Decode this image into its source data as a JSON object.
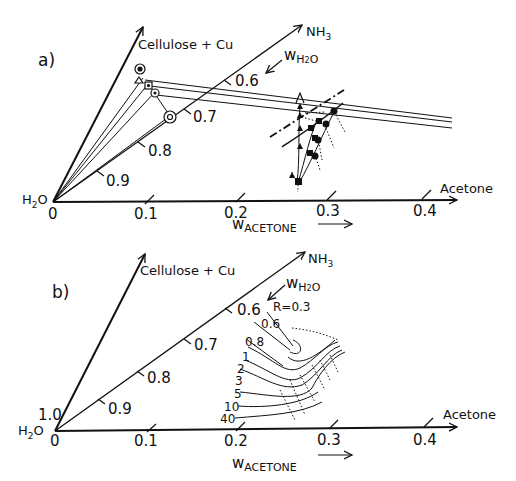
{
  "panel_a": {
    "label": "a)",
    "axes": {
      "cellulose": "Cellulose + Cu",
      "nh3": "NH",
      "nh3_sub": "3",
      "water_origin": "H",
      "water_sub": "2",
      "water_o": "O",
      "acetone": "Acetone"
    },
    "acetone_ticks": [
      "0",
      "0.1",
      "0.2",
      "0.3",
      "0.4"
    ],
    "water_ticks": [
      "0.6",
      "0.7",
      "0.8",
      "0.9"
    ],
    "w_acetone": {
      "w": "w",
      "sub": "ACETONE"
    },
    "w_h2o": {
      "w": "w",
      "sub": "H",
      "sub2": "2",
      "tail": "O"
    }
  },
  "panel_b": {
    "label": "b)",
    "axes": {
      "cellulose": "Cellulose + Cu",
      "nh3": "NH",
      "nh3_sub": "3",
      "water_origin": "H",
      "water_sub": "2",
      "water_o": "O",
      "acetone": "Acetone"
    },
    "origin_top": "1.0",
    "acetone_ticks": [
      "0",
      "0.1",
      "0.2",
      "0.3",
      "0.4"
    ],
    "water_ticks": [
      "0.6",
      "0.7",
      "0.8",
      "0.9"
    ],
    "w_acetone": {
      "w": "w",
      "sub": "ACETONE"
    },
    "w_h2o": {
      "w": "w",
      "sub": "H",
      "sub2": "2",
      "tail": "O"
    },
    "contour_labels": [
      "R=0.3",
      "0.6",
      "0.8",
      "1",
      "2",
      "3",
      "5",
      "10",
      "40"
    ]
  }
}
